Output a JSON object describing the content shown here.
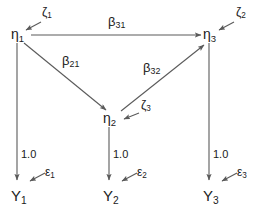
{
  "figure": {
    "type": "path-diagram",
    "background_color": "#ffffff",
    "line_color": "#5a5a5a",
    "text_color": "#1a1a1a"
  },
  "latent_variables": [
    {
      "id": "eta1",
      "symbol": "η",
      "subscript": "1",
      "x": 18,
      "y": 34
    },
    {
      "id": "eta2",
      "symbol": "η",
      "subscript": "2",
      "x": 110,
      "y": 118
    },
    {
      "id": "eta3",
      "symbol": "η",
      "subscript": "3",
      "x": 210,
      "y": 34
    }
  ],
  "disturbances": [
    {
      "id": "zeta1",
      "symbol": "ζ",
      "subscript": "1",
      "target": "eta1",
      "x": 42,
      "y": 12
    },
    {
      "id": "zeta2",
      "symbol": "ζ",
      "subscript": "2",
      "target": "eta3",
      "x": 238,
      "y": 12
    },
    {
      "id": "zeta3",
      "symbol": "ζ",
      "subscript": "3",
      "target": "eta2",
      "x": 143,
      "y": 104
    }
  ],
  "observed_variables": [
    {
      "id": "Y1",
      "symbol": "Y",
      "subscript": "1",
      "x": 18,
      "y": 196
    },
    {
      "id": "Y2",
      "symbol": "Y",
      "subscript": "2",
      "x": 110,
      "y": 196
    },
    {
      "id": "Y3",
      "symbol": "Y",
      "subscript": "3",
      "x": 210,
      "y": 196
    }
  ],
  "measurement_errors": [
    {
      "id": "epsilon1",
      "symbol": "ε",
      "subscript": "1",
      "target": "Y1",
      "x": 47,
      "y": 172
    },
    {
      "id": "epsilon2",
      "symbol": "ε",
      "subscript": "2",
      "target": "Y2",
      "x": 139,
      "y": 172
    },
    {
      "id": "epsilon3",
      "symbol": "ε",
      "subscript": "3",
      "target": "Y3",
      "x": 239,
      "y": 172
    }
  ],
  "structural_paths": [
    {
      "id": "beta31",
      "symbol": "β",
      "subscript": "31",
      "from": "eta1",
      "to": "eta3",
      "label_x": 118,
      "label_y": 22
    },
    {
      "id": "beta21",
      "symbol": "β",
      "subscript": "21",
      "from": "eta1",
      "to": "eta2",
      "label_x": 71,
      "label_y": 61
    },
    {
      "id": "beta32",
      "symbol": "β",
      "subscript": "32",
      "from": "eta2",
      "to": "eta3",
      "label_x": 152,
      "label_y": 68
    }
  ],
  "loadings": [
    {
      "id": "loading1",
      "value": "1.0",
      "from": "eta1",
      "to": "Y1",
      "x": 24,
      "y": 155
    },
    {
      "id": "loading2",
      "value": "1.0",
      "from": "eta2",
      "to": "Y2",
      "x": 116,
      "y": 155
    },
    {
      "id": "loading3",
      "value": "1.0",
      "from": "eta3",
      "to": "Y3",
      "x": 216,
      "y": 155
    }
  ]
}
